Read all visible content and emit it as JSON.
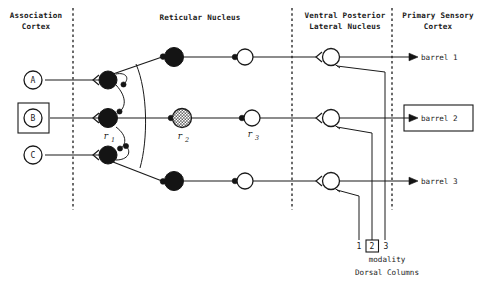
{
  "figure": {
    "background": "#ffffff",
    "ink": "#1a1a1a",
    "width": 478,
    "height": 292
  },
  "columns": [
    {
      "id": "association-cortex",
      "line1": "Association",
      "line2": "Cortex",
      "cx": 36,
      "y1": 14,
      "y2": 25
    },
    {
      "id": "reticular-nucleus",
      "line1": "Reticular Nucleus",
      "line2": "",
      "cx": 200,
      "y1": 16,
      "y2": 0
    },
    {
      "id": "vpl",
      "line1": "Ventral Posterior",
      "line2": "Lateral Nucleus",
      "cx": 345,
      "y1": 14,
      "y2": 25
    },
    {
      "id": "primary-sensory-cortex",
      "line1": "Primary Sensory",
      "line2": "Cortex",
      "cx": 438,
      "y1": 14,
      "y2": 25
    }
  ],
  "dividers": [
    {
      "id": "divider-1",
      "x": 73,
      "y_top": 8,
      "y_bottom": 210
    },
    {
      "id": "divider-2",
      "x": 292,
      "y_top": 8,
      "y_bottom": 210
    },
    {
      "id": "divider-3",
      "x": 392,
      "y_top": 8,
      "y_bottom": 210
    }
  ],
  "sources": [
    {
      "id": "source-a",
      "label": "A",
      "cx": 33,
      "cy": 80,
      "shape": "circle",
      "boxed": false
    },
    {
      "id": "source-b",
      "label": "B",
      "cx": 33,
      "cy": 118,
      "shape": "circle",
      "boxed": true
    },
    {
      "id": "source-c",
      "label": "C",
      "cx": 33,
      "cy": 155,
      "shape": "circle",
      "boxed": false
    }
  ],
  "reticular_neurons": [
    {
      "id": "r1-top",
      "cx": 108,
      "cy": 80,
      "r": 9,
      "fill": "black",
      "label": "",
      "sub": ""
    },
    {
      "id": "r1-middle",
      "cx": 108,
      "cy": 118,
      "r": 9.5,
      "fill": "black",
      "label": "r",
      "sub": "1"
    },
    {
      "id": "r1-bottom",
      "cx": 108,
      "cy": 155,
      "r": 9,
      "fill": "black",
      "label": "",
      "sub": ""
    }
  ],
  "relay_neurons": [
    {
      "id": "r2-top",
      "cx": 174,
      "cy": 57,
      "r": 9.5,
      "fill": "black",
      "label": "",
      "sub": ""
    },
    {
      "id": "r2-middle",
      "cx": 182,
      "cy": 118,
      "r": 9.5,
      "fill": "stipple",
      "label": "r",
      "sub": "2"
    },
    {
      "id": "r2-bottom",
      "cx": 174,
      "cy": 181,
      "r": 9.5,
      "fill": "black",
      "label": "",
      "sub": ""
    }
  ],
  "thalamic_neurons": [
    {
      "id": "r3-top",
      "cx": 245,
      "cy": 57,
      "r": 8,
      "fill": "white",
      "label": "",
      "sub": ""
    },
    {
      "id": "r3-middle",
      "cx": 252,
      "cy": 118,
      "r": 8,
      "fill": "white",
      "label": "r",
      "sub": "3"
    },
    {
      "id": "r3-bottom",
      "cx": 245,
      "cy": 181,
      "r": 8,
      "fill": "white",
      "label": "",
      "sub": ""
    }
  ],
  "vpl_neurons": [
    {
      "id": "vpl-1",
      "cx": 331,
      "cy": 57,
      "r": 8.5,
      "fill": "white"
    },
    {
      "id": "vpl-2",
      "cx": 331,
      "cy": 118,
      "r": 8.5,
      "fill": "white"
    },
    {
      "id": "vpl-3",
      "cx": 331,
      "cy": 181,
      "r": 8.5,
      "fill": "white"
    }
  ],
  "barrels": [
    {
      "id": "barrel-1",
      "label": "barrel 1",
      "x": 420,
      "y": 57,
      "boxed": false
    },
    {
      "id": "barrel-2",
      "label": "barrel 2",
      "x": 420,
      "y": 118,
      "boxed": true
    },
    {
      "id": "barrel-3",
      "label": "barrel 3",
      "x": 420,
      "y": 181,
      "boxed": false
    }
  ],
  "dorsal_columns": {
    "caption": "Dorsal Columns",
    "caption_x": 388,
    "caption_y": 272,
    "modality_label": "modality",
    "modality_x": 388,
    "modality_y": 259,
    "fibers": [
      {
        "id": "dc-fiber-1",
        "number": "1",
        "x": 359,
        "label_x": 359,
        "label_y": 247,
        "boxed": false,
        "target": "vpl-3"
      },
      {
        "id": "dc-fiber-2",
        "number": "2",
        "x": 372,
        "label_x": 372,
        "label_y": 247,
        "boxed": true,
        "target": "vpl-2"
      },
      {
        "id": "dc-fiber-3",
        "number": "3",
        "x": 385,
        "label_x": 385,
        "label_y": 247,
        "boxed": false,
        "target": "vpl-1"
      }
    ]
  }
}
